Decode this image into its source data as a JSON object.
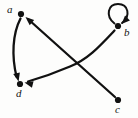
{
  "figure": {
    "kind": "directed-graph-diagram",
    "width": 138,
    "height": 118,
    "background_color": "#fdfdfc",
    "ink_color": "#111111",
    "label_color": "#141414"
  },
  "nodes": [
    {
      "id": "a",
      "label": "a",
      "x": 21,
      "y": 14,
      "label_x": 7,
      "label_y": 4
    },
    {
      "id": "b",
      "label": "b",
      "x": 118,
      "y": 26,
      "label_x": 124,
      "label_y": 27
    },
    {
      "id": "c",
      "label": "c",
      "x": 118,
      "y": 100,
      "label_x": 115,
      "label_y": 104
    },
    {
      "id": "d",
      "label": "d",
      "x": 20,
      "y": 84,
      "label_x": 16,
      "label_y": 88
    }
  ],
  "edges": [
    {
      "id": "a-d",
      "from": "a",
      "to": "d",
      "directed": true,
      "style": "curved",
      "path": "M 20.5 18.5 C 12.5 34 11.5 56 16.5 76.5",
      "arrow_at": "d",
      "arrow_x": 18.6,
      "arrow_y": 81.5,
      "arrow_angle": 76
    },
    {
      "id": "c-a",
      "from": "c",
      "to": "a",
      "directed": true,
      "style": "straight",
      "path": "M 115 97 L 28.5 19.5",
      "arrow_at": "a",
      "arrow_x": 25.5,
      "arrow_y": 17,
      "arrow_angle": 221
    },
    {
      "id": "b-d",
      "from": "b",
      "to": "d",
      "directed": true,
      "style": "curved",
      "path": "M 114.5 30.5 C 99 47 88 59 70 66.5 C 56 72.5 40 78 28 81.5",
      "arrow_at": "d",
      "arrow_x": 24.5,
      "arrow_y": 82.5,
      "arrow_angle": 194
    },
    {
      "id": "b-b",
      "from": "b",
      "to": "b",
      "directed": true,
      "style": "self-loop",
      "path": "M 114.5 23.5 C 105 16 108 4 118 4 C 128.5 4 131 16 122 23",
      "arrow_at": "b",
      "arrow_x": 121.5,
      "arrow_y": 24,
      "arrow_angle": 135
    }
  ]
}
